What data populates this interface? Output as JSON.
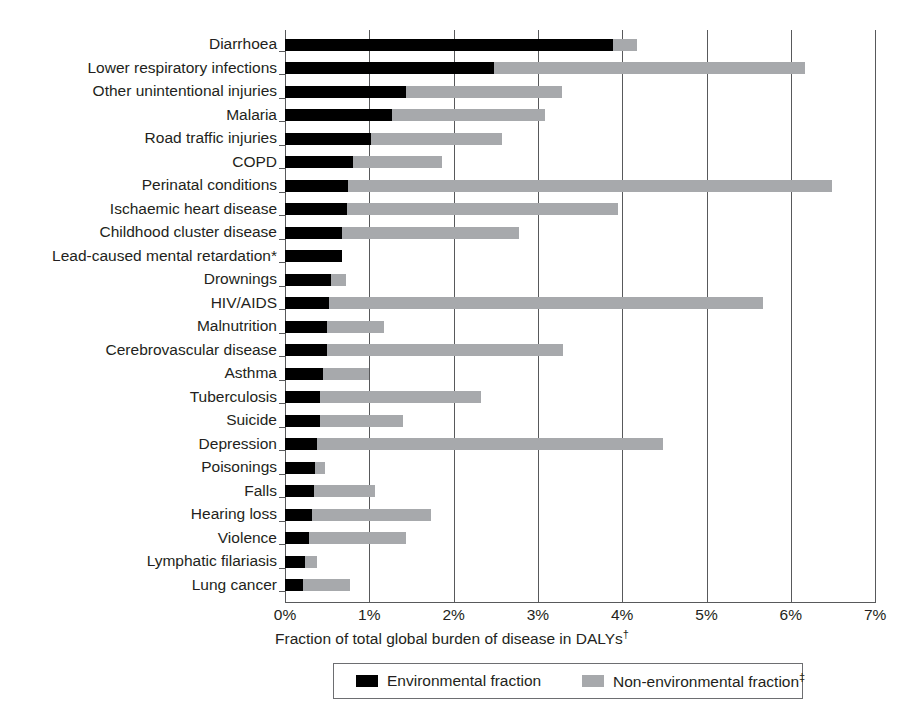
{
  "chart_data": {
    "type": "bar",
    "orientation": "horizontal",
    "stacked": true,
    "title": "",
    "xlabel": "Fraction of total global burden of disease in DALYs†",
    "ylabel": "",
    "xlim": [
      0,
      7
    ],
    "xticks": [
      "0%",
      "1%",
      "2%",
      "3%",
      "4%",
      "5%",
      "6%",
      "7%"
    ],
    "xtick_values": [
      0,
      1,
      2,
      3,
      4,
      5,
      6,
      7
    ],
    "grid": true,
    "grid_axis": "x",
    "legend_position": "bottom",
    "categories": [
      "Diarrhoea",
      "Lower respiratory infections",
      "Other unintentional injuries",
      "Malaria",
      "Road traffic injuries",
      "COPD",
      "Perinatal conditions",
      "Ischaemic heart disease",
      "Childhood cluster disease",
      "Lead-caused mental retardation*",
      "Drownings",
      "HIV/AIDS",
      "Malnutrition",
      "Cerebrovascular disease",
      "Asthma",
      "Tuberculosis",
      "Suicide",
      "Depression",
      "Poisonings",
      "Falls",
      "Hearing loss",
      "Violence",
      "Lymphatic filariasis",
      "Lung cancer"
    ],
    "series": [
      {
        "name": "Environmental fraction",
        "color": "#000000",
        "values": [
          3.89,
          2.48,
          1.44,
          1.27,
          1.02,
          0.81,
          0.75,
          0.74,
          0.68,
          0.68,
          0.55,
          0.52,
          0.5,
          0.5,
          0.45,
          0.42,
          0.41,
          0.38,
          0.35,
          0.34,
          0.32,
          0.29,
          0.24,
          0.21
        ]
      },
      {
        "name": "Non-environmental fraction‡",
        "color": "#a7a9ac",
        "values": [
          0.28,
          3.69,
          1.84,
          1.82,
          1.56,
          1.05,
          5.74,
          3.21,
          2.1,
          0.0,
          0.17,
          5.15,
          0.67,
          2.8,
          0.55,
          1.9,
          0.99,
          4.1,
          0.13,
          0.73,
          1.41,
          1.14,
          0.14,
          0.56
        ]
      }
    ],
    "totals": [
      4.17,
      6.17,
      3.28,
      3.09,
      2.58,
      1.86,
      6.49,
      3.95,
      2.78,
      0.68,
      0.72,
      5.67,
      1.17,
      3.3,
      1.0,
      2.32,
      1.4,
      4.48,
      0.48,
      1.07,
      1.73,
      1.43,
      0.38,
      0.77
    ]
  },
  "legend": {
    "items": [
      {
        "label": "Environmental fraction",
        "swatch": "env",
        "sup": ""
      },
      {
        "label": "Non-environmental fraction",
        "swatch": "non",
        "sup": "‡"
      }
    ]
  },
  "colors": {
    "environmental": "#000000",
    "non_environmental": "#a7a9ac",
    "axis": "#58595b",
    "text": "#231f20",
    "background": "#ffffff"
  }
}
